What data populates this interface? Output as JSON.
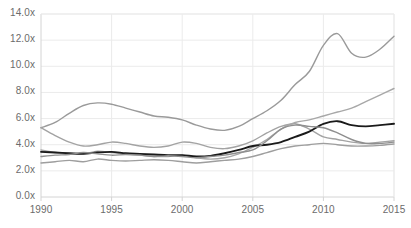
{
  "chart_data": {
    "type": "line",
    "title": "",
    "subtitle": "",
    "xlabel": "",
    "ylabel": "",
    "xlim": [
      1990,
      2015
    ],
    "ylim": [
      0.0,
      14.0
    ],
    "grid": true,
    "legend": "none",
    "y_tick_labels": [
      "0.0x",
      "2.0x",
      "4.0x",
      "6.0x",
      "8.0x",
      "10.0x",
      "12.0x",
      "14.0x"
    ],
    "y_tick_values": [
      0.0,
      2.0,
      4.0,
      6.0,
      8.0,
      10.0,
      12.0,
      14.0
    ],
    "x_tick_labels": [
      "1990",
      "1995",
      "2000",
      "2005",
      "2010",
      "2015"
    ],
    "x_tick_values": [
      1990,
      1995,
      2000,
      2005,
      2010,
      2015
    ],
    "x": [
      1990,
      1991,
      1992,
      1993,
      1994,
      1995,
      1996,
      1997,
      1998,
      1999,
      2000,
      2001,
      2002,
      2003,
      2004,
      2005,
      2006,
      2007,
      2008,
      2009,
      2010,
      2011,
      2012,
      2013,
      2014,
      2015
    ],
    "series": [
      {
        "name": "series-1-top-rising",
        "color": "#9a9a9a",
        "width": 1.4,
        "values": [
          5.3,
          5.7,
          6.4,
          7.0,
          7.2,
          7.1,
          6.8,
          6.5,
          6.2,
          6.1,
          5.9,
          5.5,
          5.2,
          5.1,
          5.4,
          6.0,
          6.6,
          7.4,
          8.6,
          9.6,
          11.6,
          12.5,
          11.0,
          10.7,
          11.3,
          12.3
        ]
      },
      {
        "name": "series-2-declining-then-rising",
        "color": "#a3a3a3",
        "width": 1.4,
        "values": [
          5.3,
          4.7,
          4.2,
          3.9,
          4.0,
          4.2,
          4.1,
          3.9,
          3.8,
          3.9,
          4.2,
          4.1,
          3.8,
          3.7,
          3.9,
          4.3,
          4.9,
          5.4,
          5.6,
          5.2,
          4.6,
          4.4,
          4.2,
          4.1,
          4.2,
          4.3
        ]
      },
      {
        "name": "series-3-steady-rising",
        "color": "#a8a8a8",
        "width": 1.4,
        "values": [
          3.6,
          3.4,
          3.3,
          3.3,
          3.5,
          3.4,
          3.3,
          3.2,
          3.1,
          3.1,
          3.2,
          3.0,
          2.9,
          3.0,
          3.3,
          3.8,
          4.4,
          5.2,
          5.7,
          5.9,
          6.2,
          6.5,
          6.8,
          7.3,
          7.8,
          8.3
        ]
      },
      {
        "name": "series-4-black-emphasis",
        "color": "#1a1a1a",
        "width": 1.9,
        "values": [
          3.45,
          3.4,
          3.35,
          3.3,
          3.4,
          3.45,
          3.35,
          3.3,
          3.25,
          3.2,
          3.2,
          3.1,
          3.15,
          3.35,
          3.6,
          3.9,
          4.0,
          4.2,
          4.6,
          5.0,
          5.6,
          5.8,
          5.5,
          5.4,
          5.5,
          5.6
        ]
      },
      {
        "name": "series-5-mid-flat",
        "color": "#8f8f8f",
        "width": 1.4,
        "values": [
          3.1,
          3.2,
          3.25,
          3.4,
          3.3,
          3.2,
          3.25,
          3.2,
          3.1,
          3.15,
          3.1,
          3.0,
          3.1,
          3.2,
          3.4,
          3.6,
          4.3,
          5.2,
          5.5,
          5.4,
          5.3,
          4.9,
          4.4,
          4.1,
          4.1,
          4.2
        ]
      },
      {
        "name": "series-6-lower-band",
        "color": "#9e9e9e",
        "width": 1.4,
        "values": [
          2.6,
          2.7,
          2.8,
          2.7,
          2.9,
          2.8,
          2.75,
          2.8,
          2.85,
          2.8,
          2.7,
          2.6,
          2.7,
          2.8,
          2.9,
          3.1,
          3.4,
          3.7,
          3.9,
          4.0,
          4.1,
          4.0,
          3.9,
          3.9,
          3.95,
          4.05
        ]
      }
    ]
  },
  "axes": {
    "plot_left": 41,
    "plot_top": 14,
    "plot_right": 394,
    "plot_bottom": 197,
    "grid_color": "#ebebeb",
    "axis_color": "#d4d4d4",
    "tick_text_color": "#6b6b6b",
    "background": "#ffffff"
  }
}
